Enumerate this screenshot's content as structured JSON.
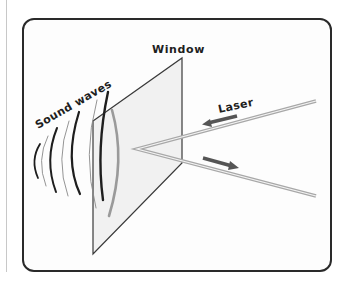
{
  "diagram": {
    "labels": {
      "window": "Window",
      "sound_waves": "Sound waves",
      "laser": "Laser"
    },
    "icons": {
      "incoming_arrow": "arrow-left-icon",
      "outgoing_arrow": "arrow-right-icon"
    },
    "colors": {
      "frame_border": "#2a2a2a",
      "pane_fill": "#eeeeee",
      "pane_edge": "#3a3a3a",
      "wave_dark": "#1e1e1e",
      "wave_light": "#777777",
      "laser_beam": "#b5b5b5",
      "arrow": "#555555"
    }
  }
}
